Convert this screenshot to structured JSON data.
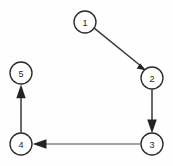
{
  "diagram": {
    "type": "directed-graph",
    "title": "",
    "background_color": "#fefefe",
    "node_fill": "#ffffff",
    "node_stroke": "#2b2b2b",
    "edge_color": "#3a3a3a",
    "arrow_color": "#232323",
    "node_radius": 11,
    "nodes": [
      {
        "id": "1",
        "label": "1",
        "cx": 85,
        "cy": 22
      },
      {
        "id": "2",
        "label": "2",
        "cx": 152,
        "cy": 78
      },
      {
        "id": "3",
        "label": "3",
        "cx": 152,
        "cy": 144
      },
      {
        "id": "4",
        "label": "4",
        "cx": 21,
        "cy": 144
      },
      {
        "id": "5",
        "label": "5",
        "cx": 21,
        "cy": 73
      }
    ],
    "edges": [
      {
        "from": "1",
        "to": "2",
        "direction": "diagonal-down-right",
        "style": "solid",
        "arrow": "filled-triangle"
      },
      {
        "from": "2",
        "to": "3",
        "direction": "down",
        "style": "solid",
        "arrow": "filled-triangle"
      },
      {
        "from": "3",
        "to": "4",
        "direction": "left",
        "style": "solid",
        "arrow": "filled-triangle"
      },
      {
        "from": "4",
        "to": "5",
        "direction": "up",
        "style": "solid",
        "arrow": "filled-triangle"
      }
    ]
  }
}
